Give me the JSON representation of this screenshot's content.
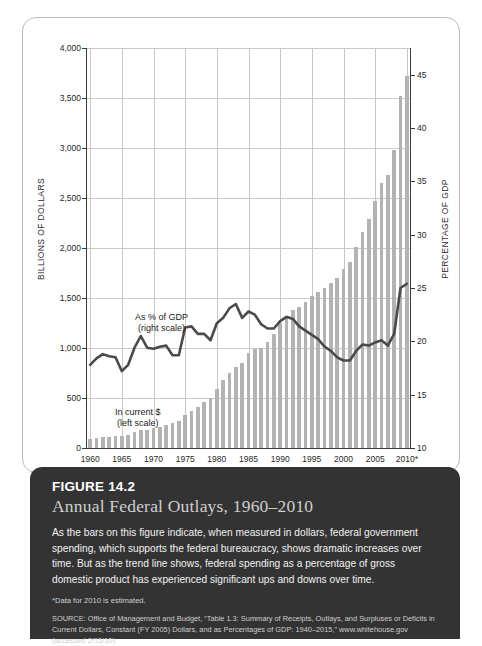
{
  "figure": {
    "number": "FIGURE 14.2",
    "title": "Annual Federal Outlays, 1960–2010",
    "description": "As the bars on this figure indicate, when measured in dollars, federal government spending, which supports the federal bureaucracy, shows dramatic increases over time. But as the trend line shows, federal spending as a percentage of gross domestic product has experienced significant ups and downs over time.",
    "note": "*Data for 2010 is estimated.",
    "source": "SOURCE: Office of Management and Budget, “Table 1.3: Summary of Receipts, Outlays, and Surpluses or Deficits in Current Dollars, Constant (FY 2005) Dollars, and as Percentages of GDP: 1940–2015,” www.whitehouse.gov (accessed 2/15/10)."
  },
  "colors": {
    "bar": "#b3b3b3",
    "line": "#4a4a4a",
    "grid": "#c9c9c9",
    "axis": "#3a3a3a",
    "panel_bg": "#333333",
    "panel_title": "#cfcfcf"
  },
  "annotations": {
    "line_label_1": "As % of GDP",
    "line_label_2": "(right scale)",
    "bar_label_1": "In current $",
    "bar_label_2": "(left scale)"
  },
  "chart_data": {
    "type": "bar",
    "title": "Annual Federal Outlays, 1960–2010",
    "xlabel": "",
    "ylabel": "BILLIONS OF DOLLARS",
    "y2label": "PERCENTAGE OF GDP",
    "ylim": [
      0,
      4000
    ],
    "y2lim": [
      10,
      47.5
    ],
    "yticks": [
      0,
      500,
      1000,
      1500,
      2000,
      2500,
      3000,
      3500,
      4000
    ],
    "ytick_labels": [
      "0",
      "500",
      "1,000",
      "1,500",
      "2,000",
      "2,500",
      "3,000",
      "3,500",
      "4,000"
    ],
    "y2ticks": [
      10,
      15,
      20,
      25,
      30,
      35,
      40,
      45
    ],
    "y2tick_labels": [
      "10",
      "15",
      "20",
      "25",
      "30",
      "35",
      "40",
      "45"
    ],
    "xticks": [
      1960,
      1965,
      1970,
      1975,
      1980,
      1985,
      1990,
      1995,
      2000,
      2005,
      2010
    ],
    "xtick_labels": [
      "1960",
      "1965",
      "1970",
      "1975",
      "1980",
      "1985",
      "1990",
      "1995",
      "2000",
      "2005",
      "2010*"
    ],
    "grid": true,
    "legend": "inline-annotations",
    "x": [
      1960,
      1961,
      1962,
      1963,
      1964,
      1965,
      1966,
      1967,
      1968,
      1969,
      1970,
      1971,
      1972,
      1973,
      1974,
      1975,
      1976,
      1977,
      1978,
      1979,
      1980,
      1981,
      1982,
      1983,
      1984,
      1985,
      1986,
      1987,
      1988,
      1989,
      1990,
      1991,
      1992,
      1993,
      1994,
      1995,
      1996,
      1997,
      1998,
      1999,
      2000,
      2001,
      2002,
      2003,
      2004,
      2005,
      2006,
      2007,
      2008,
      2009,
      2010
    ],
    "series": [
      {
        "name": "In current $ (left scale)",
        "axis": "left",
        "unit": "billions of dollars",
        "render": "bar",
        "values": [
          92,
          98,
          107,
          111,
          119,
          118,
          135,
          157,
          178,
          184,
          196,
          210,
          231,
          246,
          269,
          332,
          372,
          409,
          459,
          504,
          591,
          678,
          746,
          808,
          852,
          946,
          990,
          1004,
          1065,
          1144,
          1253,
          1324,
          1382,
          1409,
          1462,
          1516,
          1561,
          1601,
          1653,
          1702,
          1789,
          1863,
          2011,
          2160,
          2293,
          2472,
          2655,
          2729,
          2983,
          3518,
          3721
        ]
      },
      {
        "name": "As % of GDP (right scale)",
        "axis": "right",
        "unit": "percent of GDP",
        "render": "line",
        "values": [
          17.8,
          18.4,
          18.8,
          18.6,
          18.5,
          17.2,
          17.8,
          19.4,
          20.5,
          19.4,
          19.3,
          19.5,
          19.6,
          18.7,
          18.7,
          21.3,
          21.4,
          20.7,
          20.7,
          20.1,
          21.7,
          22.2,
          23.1,
          23.5,
          22.2,
          22.8,
          22.5,
          21.6,
          21.2,
          21.2,
          21.9,
          22.3,
          22.1,
          21.4,
          21.0,
          20.6,
          20.2,
          19.5,
          19.1,
          18.5,
          18.2,
          18.2,
          19.1,
          19.7,
          19.6,
          19.9,
          20.1,
          19.6,
          20.7,
          25.0,
          25.4
        ]
      }
    ]
  }
}
